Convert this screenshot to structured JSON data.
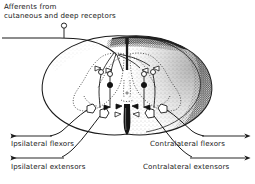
{
  "figure": {
    "title_implied": "Spinal reflex pathway: afferent input to flexor and extensor motor neurons",
    "background_color": "#ffffff",
    "ink_color": "#1b1b1b"
  },
  "labels": {
    "afferent_line1": "Afferents from",
    "afferent_line2": "cutaneous and deep receptors",
    "ipsilateral_flexors": "Ipsilateral flexors",
    "ipsilateral_extensors": "Ipsilateral extensors",
    "contralateral_flexors": "Contralateral flexors",
    "contralateral_extensors": "Contralateral extensors"
  },
  "anatomy": {
    "cord_outline": "oval transverse section of spinal cord",
    "gray_matter": "butterfly-shaped dotted outline, dorsal and ventral horns both sides",
    "white_matter": "stippled gray shading, densest in right dorsolateral funiculus",
    "dorsal_median_septum": "dark vertical line descending from dorsal midline",
    "ventral_median_fissure": "dark wedge ascending from ventral midline",
    "dorsal_funiculus": "dark shaded band along dorsal columns"
  },
  "symbols": {
    "receptor": "open circle on stalk at end of afferent fibre",
    "excitatory_interneuron": "open circle",
    "inhibitory_interneuron": "filled black circle",
    "motor_neuron": "open pentagon/triangle cell body in ventral horn",
    "excitatory_terminal": "open triangle bouton",
    "inhibitory_terminal": "filled triangle bouton",
    "output_arrow": "solid line terminating in arrowhead"
  },
  "outputs": [
    {
      "id": "ipsilateral-flexors",
      "side": "left",
      "arrow_direction": "left"
    },
    {
      "id": "ipsilateral-extensors",
      "side": "left",
      "arrow_direction": "left"
    },
    {
      "id": "contralateral-flexors",
      "side": "right",
      "arrow_direction": "right"
    },
    {
      "id": "contralateral-extensors",
      "side": "right",
      "arrow_direction": "right"
    }
  ]
}
